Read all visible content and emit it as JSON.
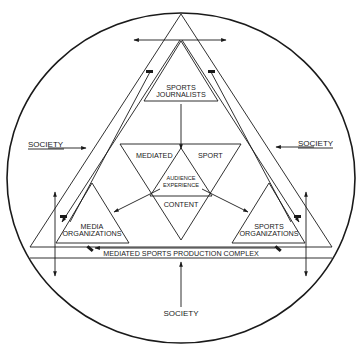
{
  "diagram": {
    "type": "conceptual-model",
    "colors": {
      "ink": "#1a1a1a",
      "background": "#ffffff"
    },
    "labels": {
      "society_left": "SOCIETY",
      "society_right": "SOCIETY",
      "society_bottom": "SOCIETY",
      "sports_journalists_line1": "SPORTS",
      "sports_journalists_line2": "JOURNALISTS",
      "mediated": "MEDIATED",
      "sport": "SPORT",
      "audience_line1": "AUDIENCE",
      "audience_line2": "EXPERIENCE",
      "content": "CONTENT",
      "media_org_line1": "MEDIA",
      "media_org_line2": "ORGANIZATIONS",
      "sports_org_line1": "SPORTS",
      "sports_org_line2": "ORGANIZATIONS",
      "production_complex": "MEDIATED SPORTS PRODUCTION COMPLEX"
    },
    "nodes": [
      {
        "id": "sports-journalists",
        "label": "SPORTS JOURNALISTS",
        "shape": "triangle"
      },
      {
        "id": "mediated-sport-content",
        "label": "MEDIATED SPORT CONTENT",
        "shape": "inverted-triangle"
      },
      {
        "id": "audience-experience",
        "label": "AUDIENCE EXPERIENCE",
        "shape": "triangle"
      },
      {
        "id": "media-organizations",
        "label": "MEDIA ORGANIZATIONS",
        "shape": "triangle"
      },
      {
        "id": "sports-organizations",
        "label": "SPORTS ORGANIZATIONS",
        "shape": "triangle"
      },
      {
        "id": "production-complex",
        "label": "MEDIATED SPORTS PRODUCTION COMPLEX",
        "shape": "outer-triangle"
      },
      {
        "id": "society",
        "label": "SOCIETY",
        "shape": "circle"
      }
    ],
    "edges": [
      {
        "from": "sports-journalists",
        "to": "mediated-sport-content"
      },
      {
        "from": "audience-experience",
        "to": "media-organizations"
      },
      {
        "from": "audience-experience",
        "to": "sports-organizations"
      },
      {
        "from": "society",
        "to": "production-complex",
        "note": "left, right, bottom"
      },
      {
        "from": "media-organizations",
        "to": "sports-organizations",
        "note": "bidirectional along base"
      },
      {
        "from": "sports-journalists",
        "to": "media-organizations",
        "note": "along left edge"
      },
      {
        "from": "sports-journalists",
        "to": "sports-organizations",
        "note": "along right edge"
      }
    ]
  }
}
